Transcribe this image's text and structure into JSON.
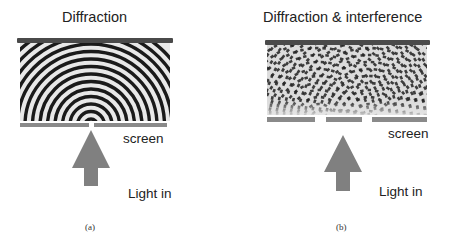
{
  "panels": [
    {
      "id": "a",
      "title": "Diffraction",
      "screen_label": "screen",
      "light_label": "Light in",
      "caption": "(a)",
      "slits": 1,
      "pattern": "concentric semicircular wavefronts from single slit"
    },
    {
      "id": "b",
      "title": "Diffraction & interference",
      "screen_label": "screen",
      "light_label": "Light in",
      "caption": "(b)",
      "slits": 2,
      "pattern": "two-source interference checkerboard"
    }
  ],
  "colors": {
    "top_bar": "#4a4a4a",
    "screen_bar": "#8a8a8a",
    "arrow": "#808080",
    "wave_dark": "#1a1a1a",
    "wave_light": "#e8e8e8"
  }
}
